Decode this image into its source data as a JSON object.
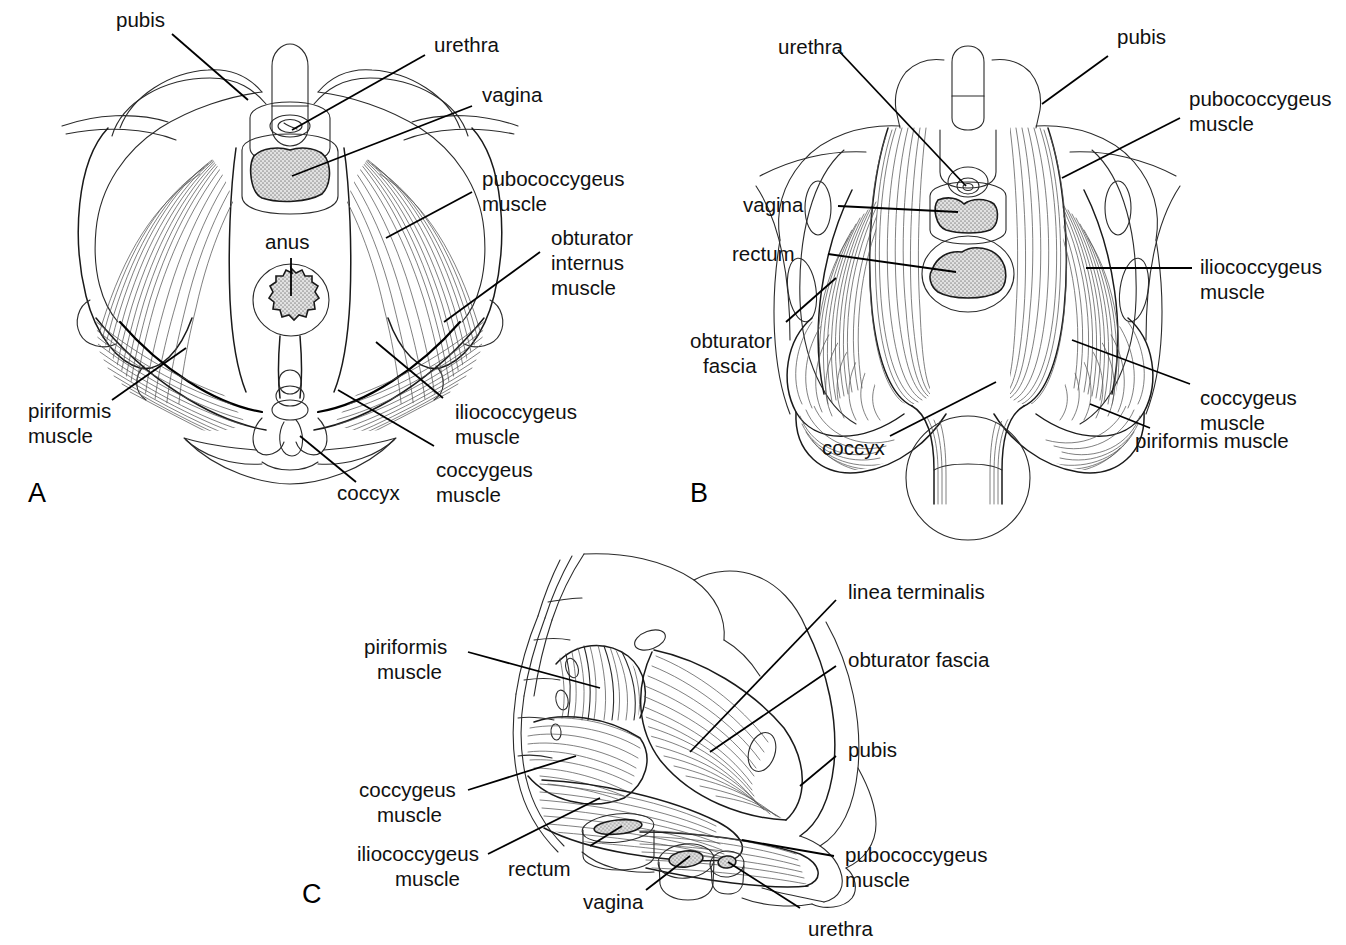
{
  "figure": {
    "background_color": "#ffffff",
    "ink_color": "#111111",
    "organ_fill_color": "#c9c9c9",
    "panels": [
      {
        "letter": "A",
        "view": "inferior (perineal) view of the pelvic floor",
        "labels": [
          "pubis",
          "urethra",
          "vagina",
          "pubococcygeus muscle",
          "obturator internus muscle",
          "anus",
          "iliococcygeus muscle",
          "coccygeus muscle",
          "coccyx",
          "piriformis muscle"
        ]
      },
      {
        "letter": "B",
        "view": "superior (intrapelvic) view of the pelvic diaphragm",
        "labels": [
          "urethra",
          "pubis",
          "pubococcygeus muscle",
          "vagina",
          "rectum",
          "iliococcygeus muscle",
          "obturator fascia",
          "coccygeus muscle",
          "piriformis muscle",
          "coccyx"
        ]
      },
      {
        "letter": "C",
        "view": "oblique lateral view of the left hemipelvis",
        "labels": [
          "linea terminalis",
          "obturator fascia",
          "pubis",
          "pubococcygeus muscle",
          "piriformis muscle",
          "coccygeus muscle",
          "iliococcygeus muscle",
          "rectum",
          "vagina",
          "urethra"
        ]
      }
    ]
  },
  "panel_a": {
    "letter": "A",
    "labels": {
      "pubis": "pubis",
      "urethra": "urethra",
      "vagina": "vagina",
      "pubococcygeus_line1": "pubococcygeus",
      "pubococcygeus_line2": "muscle",
      "obturator_line1": "obturator",
      "obturator_line2": "internus",
      "obturator_line3": "muscle",
      "anus": "anus",
      "iliococcygeus_line1": "iliococcygeus",
      "iliococcygeus_line2": "muscle",
      "coccygeus_line1": "coccygeus",
      "coccygeus_line2": "muscle",
      "coccyx": "coccyx",
      "piriformis_line1": "piriformis",
      "piriformis_line2": "muscle"
    }
  },
  "panel_b": {
    "letter": "B",
    "labels": {
      "urethra": "urethra",
      "pubis": "pubis",
      "pubococcygeus_line1": "pubococcygeus",
      "pubococcygeus_line2": "muscle",
      "vagina": "vagina",
      "rectum": "rectum",
      "iliococcygeus_line1": "iliococcygeus",
      "iliococcygeus_line2": "muscle",
      "obturator_line1": "obturator",
      "obturator_line2": "fascia",
      "coccygeus_line1": "coccygeus",
      "coccygeus_line2": "muscle",
      "piriformis": "piriformis muscle",
      "coccyx": "coccyx"
    }
  },
  "panel_c": {
    "letter": "C",
    "labels": {
      "linea_terminalis": "linea terminalis",
      "obturator_fascia": "obturator fascia",
      "pubis": "pubis",
      "pubococcygeus_line1": "pubococcygeus",
      "pubococcygeus_line2": "muscle",
      "piriformis_line1": "piriformis",
      "piriformis_line2": "muscle",
      "coccygeus_line1": "coccygeus",
      "coccygeus_line2": "muscle",
      "iliococcygeus_line1": "iliococcygeus",
      "iliococcygeus_line2": "muscle",
      "rectum": "rectum",
      "vagina": "vagina",
      "urethra": "urethra"
    }
  }
}
